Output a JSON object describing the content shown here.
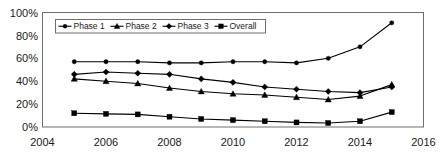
{
  "chart_data": {
    "type": "line",
    "title": "",
    "xlabel": "",
    "ylabel": "",
    "x": [
      2005,
      2006,
      2007,
      2008,
      2009,
      2010,
      2011,
      2012,
      2013,
      2014,
      2015
    ],
    "xlim": [
      2004,
      2016
    ],
    "ylim": [
      0,
      100
    ],
    "xticks": [
      2004,
      2006,
      2008,
      2010,
      2012,
      2014,
      2016
    ],
    "xtick_labels": [
      "2004",
      "2006",
      "2008",
      "2010",
      "2012",
      "2014",
      "2016"
    ],
    "yticks": [
      0,
      20,
      40,
      60,
      80,
      100
    ],
    "ytick_labels": [
      "0%",
      "20%",
      "40%",
      "60%",
      "80%",
      "100%"
    ],
    "grid": false,
    "legend_position": "upper-left-inside",
    "series": [
      {
        "name": "Phase 1",
        "marker": "circle",
        "color": "#000000",
        "values": [
          57,
          57,
          57,
          56,
          56,
          57,
          57,
          56,
          60,
          70,
          91
        ]
      },
      {
        "name": "Phase 2",
        "marker": "triangle",
        "color": "#000000",
        "values": [
          42,
          40,
          38,
          34,
          31,
          29,
          28,
          26,
          24,
          27,
          37
        ]
      },
      {
        "name": "Phase 3",
        "marker": "diamond",
        "color": "#000000",
        "values": [
          46,
          48,
          47,
          46,
          42,
          39,
          35,
          33,
          31,
          30,
          35
        ]
      },
      {
        "name": "Overall",
        "marker": "square",
        "color": "#000000",
        "values": [
          12,
          11.5,
          11,
          9,
          7,
          6,
          5,
          4,
          3.5,
          5,
          13
        ]
      }
    ]
  },
  "legend": {
    "entries": [
      {
        "label": "Phase 1"
      },
      {
        "label": "Phase 2"
      },
      {
        "label": "Phase 3"
      },
      {
        "label": "Overall"
      }
    ]
  },
  "axes": {
    "y_labels": [
      "100%",
      "80%",
      "60%",
      "40%",
      "20%",
      "0%"
    ],
    "x_labels": [
      "2004",
      "2006",
      "2008",
      "2010",
      "2012",
      "2014",
      "2016"
    ]
  }
}
